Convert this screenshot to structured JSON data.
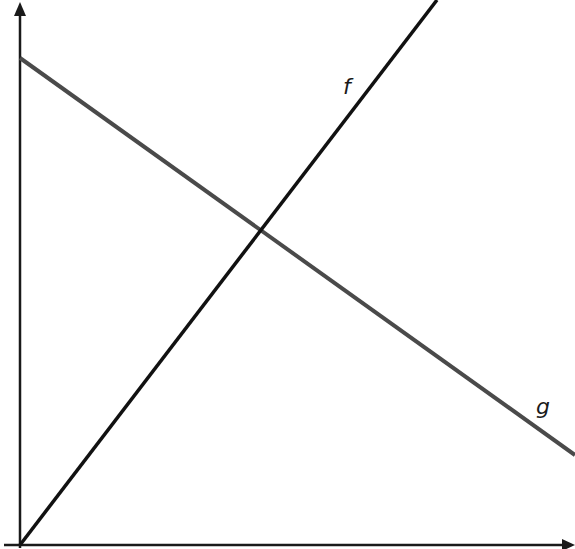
{
  "diagram": {
    "type": "line-graph-two-lines",
    "background": "#ffffff",
    "axes": {
      "color": "#1a1a1a",
      "x_axis": {
        "arrow": true,
        "label": ""
      },
      "y_axis": {
        "arrow": true,
        "label": ""
      },
      "ticks": "none"
    },
    "lines": [
      {
        "name": "f",
        "label": "f",
        "color": "#111111",
        "description": "increasing line starting at origin",
        "slope_sign": "positive"
      },
      {
        "name": "g",
        "label": "g",
        "color": "#4a4a4a",
        "description": "decreasing line starting on the y-axis",
        "slope_sign": "negative"
      }
    ],
    "intersection": {
      "lines": [
        "f",
        "g"
      ],
      "marked": false
    }
  }
}
